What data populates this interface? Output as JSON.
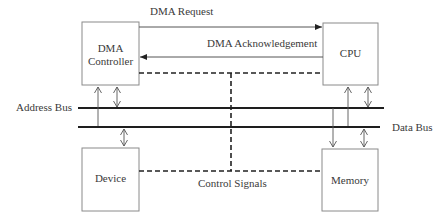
{
  "diagram": {
    "colors": {
      "line": "#333333",
      "box_border": "#8a8a8a",
      "text": "#3a3a3a",
      "background": "#ffffff"
    },
    "blocks": [
      {
        "id": "dma_controller",
        "label_line1": "DMA",
        "label_line2": "Controller"
      },
      {
        "id": "cpu",
        "label": "CPU"
      },
      {
        "id": "device",
        "label": "Device"
      },
      {
        "id": "memory",
        "label": "Memory"
      }
    ],
    "buses": {
      "address_bus": "Address Bus",
      "data_bus": "Data Bus"
    },
    "signals": {
      "dma_request": "DMA Request",
      "dma_acknowledgement": "DMA Acknowledgement",
      "control_signals": "Control Signals"
    }
  }
}
